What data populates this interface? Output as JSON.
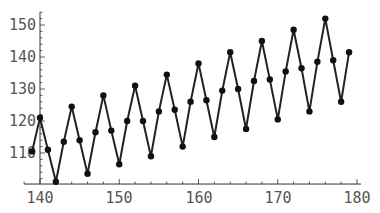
{
  "chart_data": {
    "type": "line",
    "title": "",
    "xlabel": "",
    "ylabel": "",
    "xlim": [
      138,
      180.5
    ],
    "ylim": [
      100.3,
      154
    ],
    "grid": false,
    "legend": null,
    "markers": true,
    "x_ticks": [
      140,
      150,
      160,
      170,
      180
    ],
    "y_ticks": [
      110,
      120,
      130,
      140,
      150
    ],
    "x": [
      139,
      140,
      141,
      142,
      143,
      144,
      145,
      146,
      147,
      148,
      149,
      150,
      151,
      152,
      153,
      154,
      155,
      156,
      157,
      158,
      159,
      160,
      161,
      162,
      163,
      164,
      165,
      166,
      167,
      168,
      169,
      170,
      171,
      172,
      173,
      174,
      175,
      176,
      177,
      178,
      179
    ],
    "series": [
      {
        "name": "series-1",
        "color": "#222222",
        "values": [
          110.5,
          121,
          111,
          101,
          113.5,
          124.5,
          114,
          103.5,
          116.5,
          128,
          117,
          106.5,
          120,
          131,
          120,
          109,
          123,
          134.5,
          123.5,
          112,
          126,
          138,
          126.5,
          115,
          129.5,
          141.5,
          130,
          117.5,
          132.5,
          145,
          133,
          120.5,
          135.5,
          148.5,
          136.5,
          123,
          138.5,
          152,
          139,
          126,
          141.5
        ]
      }
    ]
  },
  "axis_labels": {
    "x": [
      "140",
      "150",
      "160",
      "170",
      "180"
    ],
    "y": [
      "110",
      "120",
      "130",
      "140",
      "150"
    ]
  }
}
